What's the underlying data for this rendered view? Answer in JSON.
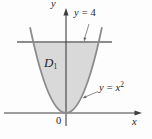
{
  "figure": {
    "labels": {
      "y_axis": "y",
      "x_axis": "x",
      "origin": "0",
      "region": {
        "base": "D",
        "sub": "1"
      },
      "line": {
        "lhs": "y",
        "eq": "=",
        "rhs": "4"
      },
      "curve": {
        "lhs": "y",
        "eq": "=",
        "rhs": "x",
        "sup": "2"
      }
    },
    "colors": {
      "region_fill": "#d9d9d9",
      "line_stroke": "#8c8c8c",
      "curve_stroke": "#8c8c8c",
      "axis": "#3f3f3f",
      "leader": "#6e6e6e",
      "text": "#1f1f1f",
      "background": "#fdfdfd"
    }
  }
}
